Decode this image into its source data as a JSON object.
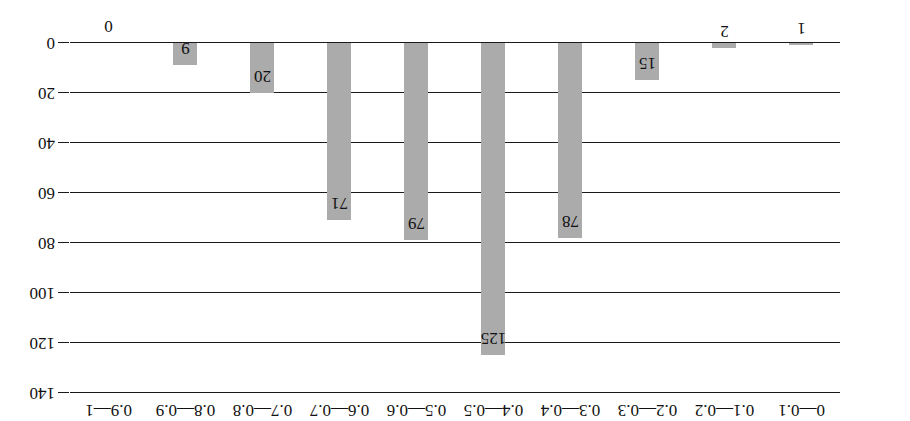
{
  "chart_data": {
    "type": "bar",
    "title": "",
    "subtitle": "",
    "xlabel": "",
    "ylabel": "",
    "orientation": "rotated-180",
    "grid": true,
    "legend": null,
    "categories": [
      "0—0.1",
      "0.1—0.2",
      "0.2—0.3",
      "0.3—0.4",
      "0.4—0.5",
      "0.5—0.6",
      "0.6—0.7",
      "0.7—0.8",
      "0.8—0.9",
      "0.9—1"
    ],
    "values": [
      1,
      2,
      15,
      78,
      125,
      79,
      71,
      20,
      9,
      0
    ],
    "data_labels": [
      "1",
      "2",
      "15",
      "78",
      "125",
      "79",
      "71",
      "20",
      "9",
      "0"
    ],
    "ylim": [
      0,
      140
    ],
    "yticks": [
      0,
      20,
      40,
      60,
      80,
      100,
      120,
      140
    ],
    "ytick_labels": [
      "0",
      "20",
      "40",
      "60",
      "80",
      "100",
      "120",
      "140"
    ],
    "bar_color": "#ababab",
    "axis_color": "#1a1a1a"
  }
}
